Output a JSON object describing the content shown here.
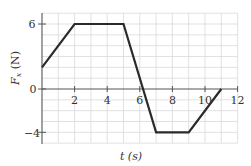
{
  "chart_data": {
    "type": "line",
    "title": "",
    "xlabel": "t (s)",
    "ylabel": "F_x (N)",
    "xlim": [
      0,
      12
    ],
    "ylim": [
      -5,
      7
    ],
    "x_ticks": [
      2,
      4,
      6,
      8,
      10,
      12
    ],
    "y_ticks": [
      6,
      0,
      -4
    ],
    "grid": true,
    "legend": null,
    "series": [
      {
        "name": "F_x",
        "x": [
          0,
          2,
          5,
          7,
          9,
          11
        ],
        "y": [
          2,
          6,
          6,
          -4,
          -4,
          0
        ]
      }
    ]
  },
  "labels": {
    "x_axis": "t (s)",
    "y_axis_main": "F",
    "y_axis_sub": "x",
    "y_axis_unit": " (N)",
    "x_tick_2": "2",
    "x_tick_4": "4",
    "x_tick_6": "6",
    "x_tick_8": "8",
    "x_tick_10": "10",
    "x_tick_12": "12",
    "y_tick_6": "6",
    "y_tick_0": "0",
    "y_tick_neg4": "−4"
  },
  "colors": {
    "line": "#2a2a2a",
    "grid": "#d9d9d9",
    "axis": "#555555"
  }
}
